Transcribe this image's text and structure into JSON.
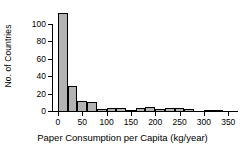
{
  "chart_data": {
    "type": "bar",
    "title": "",
    "xlabel": "Paper Consumption per Capita (kg/year)",
    "ylabel": "No. of Countries",
    "xlim": [
      -12,
      370
    ],
    "ylim": [
      0,
      118
    ],
    "grid": false,
    "legend": null,
    "bin_width": 20,
    "xticks": [
      0,
      50,
      100,
      150,
      200,
      250,
      300,
      350
    ],
    "xtick_labels": [
      "0",
      "50",
      "100",
      "150",
      "200",
      "250",
      "300",
      "350"
    ],
    "yticks": [
      0,
      20,
      40,
      60,
      80,
      100
    ],
    "ytick_labels": [
      "0",
      "20",
      "40",
      "60",
      "80",
      "100"
    ],
    "bins": [
      {
        "start": 0,
        "end": 20,
        "value": 112
      },
      {
        "start": 20,
        "end": 40,
        "value": 29
      },
      {
        "start": 40,
        "end": 60,
        "value": 12
      },
      {
        "start": 60,
        "end": 80,
        "value": 10
      },
      {
        "start": 80,
        "end": 100,
        "value": 2
      },
      {
        "start": 100,
        "end": 120,
        "value": 4
      },
      {
        "start": 120,
        "end": 140,
        "value": 3
      },
      {
        "start": 140,
        "end": 160,
        "value": 1
      },
      {
        "start": 160,
        "end": 180,
        "value": 3
      },
      {
        "start": 180,
        "end": 200,
        "value": 5
      },
      {
        "start": 200,
        "end": 220,
        "value": 2
      },
      {
        "start": 220,
        "end": 240,
        "value": 3
      },
      {
        "start": 240,
        "end": 260,
        "value": 3
      },
      {
        "start": 260,
        "end": 280,
        "value": 2
      },
      {
        "start": 280,
        "end": 300,
        "value": 0
      },
      {
        "start": 300,
        "end": 320,
        "value": 1
      },
      {
        "start": 320,
        "end": 340,
        "value": 1
      }
    ],
    "colors": {
      "bar_fill": "#b3b3b3",
      "bar_edge": "#000000",
      "axis": "#000000",
      "background": "#ffffff",
      "text": "#000000"
    }
  }
}
